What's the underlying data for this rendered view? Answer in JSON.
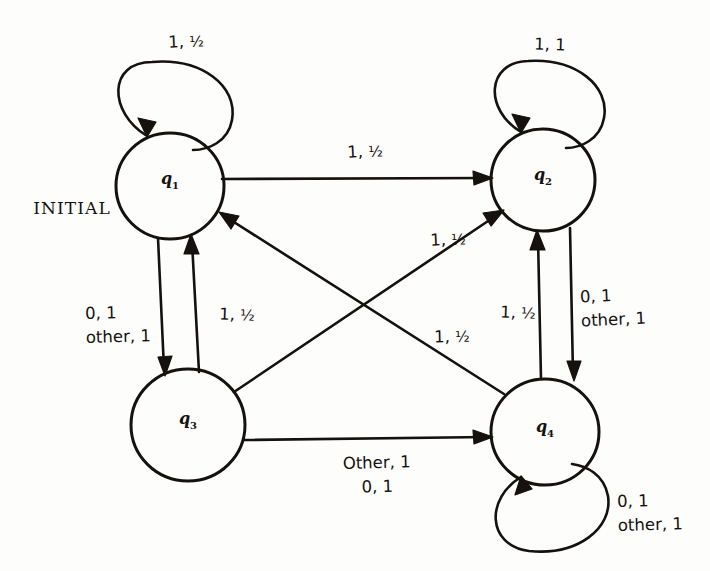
{
  "figure": {
    "type": "state-transition-diagram",
    "initial_marker": "INITIAL",
    "background_color": "#fdfdfc",
    "ink_color": "#15110f"
  },
  "states": [
    {
      "id": "q1",
      "label": "q",
      "sub": "1",
      "cx": 170,
      "cy": 186,
      "r": 53,
      "is_initial": true
    },
    {
      "id": "q2",
      "label": "q",
      "sub": "2",
      "cx": 543,
      "cy": 180,
      "r": 51,
      "is_initial": false
    },
    {
      "id": "q3",
      "label": "q",
      "sub": "3",
      "cx": 188,
      "cy": 425,
      "r": 56,
      "is_initial": false
    },
    {
      "id": "q4",
      "label": "q",
      "sub": "4",
      "cx": 545,
      "cy": 432,
      "r": 53,
      "is_initial": false
    }
  ],
  "transitions": [
    {
      "id": "t-q1-self",
      "from": "q1",
      "to": "q1",
      "kind": "self-loop-top",
      "label_line1": "1, ",
      "label_frac": "½",
      "label_line2": "",
      "lx": 186,
      "ly": 42
    },
    {
      "id": "t-q2-self",
      "from": "q2",
      "to": "q2",
      "kind": "self-loop-top",
      "label_line1": "1, 1",
      "label_frac": "",
      "label_line2": "",
      "lx": 550,
      "ly": 45
    },
    {
      "id": "t-q4-self",
      "from": "q4",
      "to": "q4",
      "kind": "self-loop-bottom",
      "label_line1": "0, 1",
      "label_frac": "",
      "label_line2": "other, 1",
      "lx": 650,
      "ly": 513
    },
    {
      "id": "t-q1-q2",
      "from": "q1",
      "to": "q2",
      "kind": "straight-top",
      "label_line1": "1, ",
      "label_frac": "½",
      "label_line2": "",
      "lx": 365,
      "ly": 152
    },
    {
      "id": "t-q1-q3",
      "from": "q1",
      "to": "q3",
      "kind": "vertical-down",
      "label_line1": "0, 1",
      "label_frac": "",
      "label_line2": "other, 1",
      "lx": 118,
      "ly": 325
    },
    {
      "id": "t-q3-q1",
      "from": "q3",
      "to": "q1",
      "kind": "vertical-up",
      "label_line1": "1, ",
      "label_frac": "½",
      "label_line2": "",
      "lx": 237,
      "ly": 315
    },
    {
      "id": "t-q2-q4",
      "from": "q2",
      "to": "q4",
      "kind": "vertical-down",
      "label_line1": "0, 1",
      "label_frac": "",
      "label_line2": "other, 1",
      "lx": 613,
      "ly": 308
    },
    {
      "id": "t-q4-q2",
      "from": "q4",
      "to": "q2",
      "kind": "vertical-up",
      "label_line1": "1, ",
      "label_frac": "½",
      "label_line2": "",
      "lx": 518,
      "ly": 313
    },
    {
      "id": "t-q3-q2",
      "from": "q3",
      "to": "q2",
      "kind": "diagonal-up-right",
      "label_line1": "1, ",
      "label_frac": "½",
      "label_line2": "",
      "lx": 448,
      "ly": 240
    },
    {
      "id": "t-q4-q1",
      "from": "q4",
      "to": "q1",
      "kind": "diagonal-up-left",
      "label_line1": "1, ",
      "label_frac": "½",
      "label_line2": "",
      "lx": 452,
      "ly": 337
    },
    {
      "id": "t-q3-q4",
      "from": "q3",
      "to": "q4",
      "kind": "straight-bottom",
      "label_line1": "Other, 1",
      "label_frac": "",
      "label_line2": "0, 1",
      "lx": 377,
      "ly": 475
    }
  ]
}
